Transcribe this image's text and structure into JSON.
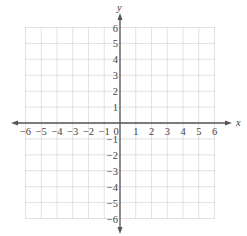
{
  "chart_data": {
    "type": "scatter",
    "title": "",
    "xlabel": "x",
    "ylabel": "y",
    "xlim": [
      -6,
      6
    ],
    "ylim": [
      -6,
      6
    ],
    "grid": true,
    "grid_style": "dotted",
    "x_ticks": [
      "-6",
      "-5",
      "-4",
      "-3",
      "-2",
      "-1",
      "0",
      "1",
      "2",
      "3",
      "4",
      "5",
      "6"
    ],
    "y_ticks": [
      "-6",
      "-5",
      "-4",
      "-3",
      "-2",
      "-1",
      "1",
      "2",
      "3",
      "4",
      "5",
      "6"
    ],
    "series": [],
    "legend": null
  },
  "axes": {
    "x_label": "x",
    "y_label": "y",
    "origin_label": "0"
  },
  "colors": {
    "grid": "#b8b8b8",
    "axis": "#555555",
    "text": "#444444"
  }
}
